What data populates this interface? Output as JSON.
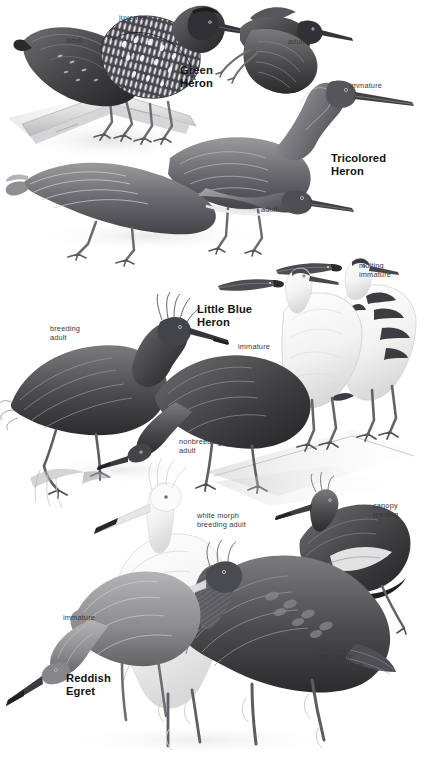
{
  "page": {
    "kind": "field-guide-plate",
    "background_color": "#ffffff",
    "label_color": "#39383a",
    "species_color": "#111214",
    "width": 433,
    "height": 761
  },
  "species": [
    {
      "id": "green-heron",
      "name_line1": "Green",
      "name_line2": "Heron",
      "x": 180,
      "y": 64
    },
    {
      "id": "tricolored-heron",
      "name_line1": "Tricolored",
      "name_line2": "Heron",
      "x": 331,
      "y": 152
    },
    {
      "id": "little-blue-heron",
      "name_line1": "Little Blue",
      "name_line2": "Heron",
      "x": 197,
      "y": 303
    },
    {
      "id": "reddish-egret",
      "name_line1": "Reddish",
      "name_line2": "Egret",
      "x": 66,
      "y": 672
    }
  ],
  "labels": [
    {
      "id": "green-heron-juvenile",
      "text": "juvenile",
      "x": 119,
      "y": 13,
      "align": "left"
    },
    {
      "id": "green-heron-adult",
      "text": "adult",
      "x": 66,
      "y": 36,
      "align": "left"
    },
    {
      "id": "green-heron-flight-adult",
      "text": "adult",
      "x": 288,
      "y": 37,
      "align": "left"
    },
    {
      "id": "tricolored-heron-immature",
      "text": "immature",
      "x": 350,
      "y": 81,
      "align": "left"
    },
    {
      "id": "tricolored-heron-adult",
      "text": "adult",
      "x": 261,
      "y": 205,
      "align": "left"
    },
    {
      "id": "little-blue-heron-molting",
      "text": "molting\nimmature",
      "x": 359,
      "y": 261,
      "align": "left"
    },
    {
      "id": "little-blue-heron-breeding",
      "text": "breeding\nadult",
      "x": 50,
      "y": 324,
      "align": "left"
    },
    {
      "id": "little-blue-heron-immature",
      "text": "immature",
      "x": 238,
      "y": 342,
      "align": "left"
    },
    {
      "id": "little-blue-heron-nonbreeding",
      "text": "nonbreeding\nadult",
      "x": 179,
      "y": 437,
      "align": "left"
    },
    {
      "id": "reddish-egret-white-morph",
      "text": "white morph\nbreeding adult",
      "x": 197,
      "y": 511,
      "align": "left"
    },
    {
      "id": "reddish-egret-canopy-feeding",
      "text": "canopy\nfeeding",
      "x": 373,
      "y": 501,
      "align": "left"
    },
    {
      "id": "reddish-egret-immature",
      "text": "immature",
      "x": 63,
      "y": 613,
      "align": "left"
    },
    {
      "id": "reddish-egret-dark-morph",
      "text": "dark morph\nbreeding adult",
      "x": 314,
      "y": 652,
      "align": "left"
    }
  ],
  "figures": [
    {
      "id": "green-heron-adult-figure",
      "species": "green-heron",
      "plumage": "adult",
      "pose": "perched-on-branch"
    },
    {
      "id": "green-heron-juvenile-figure",
      "species": "green-heron",
      "plumage": "juvenile",
      "pose": "standing-streaked"
    },
    {
      "id": "green-heron-flight-figure",
      "species": "green-heron",
      "plumage": "adult",
      "pose": "flight"
    },
    {
      "id": "tricolored-heron-immature-figure",
      "species": "tricolored-heron",
      "plumage": "immature",
      "pose": "standing-neck-raised"
    },
    {
      "id": "tricolored-heron-adult-figure",
      "species": "tricolored-heron",
      "plumage": "adult",
      "pose": "crouched-foraging"
    },
    {
      "id": "little-blue-heron-breeding-figure",
      "species": "little-blue-heron",
      "plumage": "breeding adult",
      "pose": "standing-plumes"
    },
    {
      "id": "little-blue-heron-nonbreeding-figure",
      "species": "little-blue-heron",
      "plumage": "nonbreeding adult",
      "pose": "crouched-foraging"
    },
    {
      "id": "little-blue-heron-immature-figure",
      "species": "little-blue-heron",
      "plumage": "immature",
      "pose": "standing-white"
    },
    {
      "id": "little-blue-heron-molting-figure",
      "species": "little-blue-heron",
      "plumage": "molting immature",
      "pose": "standing-pied"
    },
    {
      "id": "reddish-egret-immature-figure",
      "species": "reddish-egret",
      "plumage": "immature",
      "pose": "crouched-foraging"
    },
    {
      "id": "reddish-egret-white-morph-figure",
      "species": "reddish-egret",
      "plumage": "white morph breeding adult",
      "pose": "standing-plumes"
    },
    {
      "id": "reddish-egret-dark-morph-figure",
      "species": "reddish-egret",
      "plumage": "dark morph breeding adult",
      "pose": "standing-shaggy"
    },
    {
      "id": "reddish-egret-canopy-feeding-figure",
      "species": "reddish-egret",
      "plumage": "dark morph",
      "pose": "canopy-feeding"
    }
  ]
}
